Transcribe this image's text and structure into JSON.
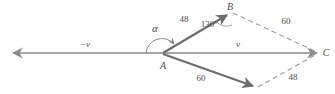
{
  "figure": {
    "stroke_color": "#6e6e6e",
    "dash_color": "#9a9a9a",
    "text_color": "#4d4d4d",
    "background": "#ffffff"
  },
  "points": {
    "A": {
      "label": "A",
      "x": 162,
      "y": 53
    },
    "B": {
      "label": "B",
      "x": 230,
      "y": 6
    },
    "C": {
      "label": "C",
      "x": 326,
      "y": 53
    }
  },
  "vectors": {
    "minus_v": {
      "label": "−v",
      "x": 85,
      "y": 44
    },
    "v": {
      "label": "v",
      "x": 238,
      "y": 44
    }
  },
  "angles": {
    "alpha": {
      "label": "α",
      "x": 155,
      "y": 28
    },
    "interior": {
      "value": "130",
      "unit": "°",
      "x": 209,
      "y": 24
    }
  },
  "magnitudes": [
    {
      "name": "ab-magnitude",
      "value": "48",
      "x": 184,
      "y": 19
    },
    {
      "name": "bc-magnitude",
      "value": "60",
      "x": 286,
      "y": 21
    },
    {
      "name": "ad-magnitude",
      "value": "60",
      "x": 201,
      "y": 78
    },
    {
      "name": "dc-magnitude",
      "value": "48",
      "x": 293,
      "y": 77
    }
  ]
}
